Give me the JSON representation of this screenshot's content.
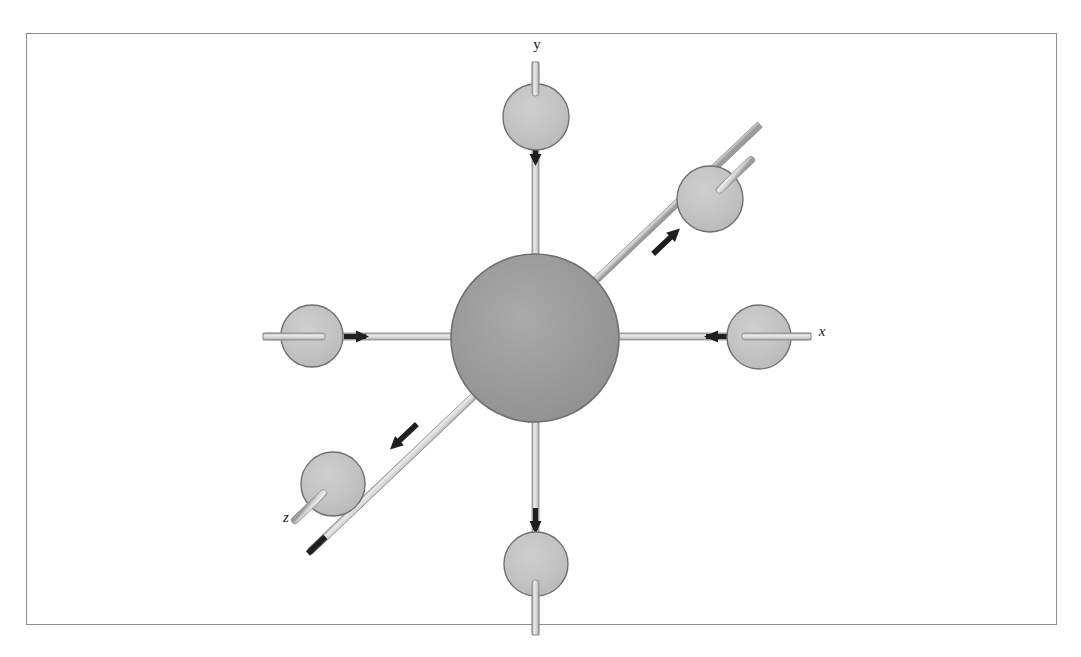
{
  "figure": {
    "frame": {
      "x": 26,
      "y": 33,
      "width": 1031,
      "height": 592,
      "border_color": "#8d8d8d",
      "background_color": "#ffffff"
    },
    "colors": {
      "center_sphere_fill": "#9a9a9a",
      "center_sphere_stroke": "#6f6f6f",
      "ligand_sphere_fill": "#c2c2c2",
      "ligand_sphere_stroke": "#6f6f6f",
      "bond_rod_fill": "#d8d8d8",
      "bond_rod_stroke": "#8c8c8c",
      "arrow_color": "#1f1f1f",
      "label_color": "#1a1a1a"
    },
    "center_atom": {
      "name": "central-sphere",
      "cx": 535,
      "cy": 338,
      "r": 84
    },
    "axes": [
      {
        "id": "y",
        "label": "y",
        "label_x": 537,
        "label_y": 49,
        "italic": false
      },
      {
        "id": "x",
        "label": "x",
        "label_x": 822,
        "label_y": 336,
        "italic": true
      },
      {
        "id": "z",
        "label": "z",
        "label_x": 286,
        "label_y": 522,
        "italic": true
      }
    ],
    "ligands": [
      {
        "id": "y-positive",
        "name": "ligand-sphere-top",
        "cx": 536,
        "cy": 117,
        "r": 33,
        "angle_deg": 270
      },
      {
        "id": "y-negative",
        "name": "ligand-sphere-bottom",
        "cx": 536,
        "cy": 564,
        "r": 32,
        "angle_deg": 90
      },
      {
        "id": "x-positive",
        "name": "ligand-sphere-right",
        "cx": 759,
        "cy": 337,
        "r": 32,
        "angle_deg": 0
      },
      {
        "id": "x-negative",
        "name": "ligand-sphere-left",
        "cx": 312,
        "cy": 336,
        "r": 31,
        "angle_deg": 180
      },
      {
        "id": "z-negative",
        "name": "ligand-sphere-upper-right",
        "cx": 710,
        "cy": 199,
        "r": 33,
        "angle_deg": 315
      },
      {
        "id": "z-positive",
        "name": "ligand-sphere-lower-left",
        "cx": 333,
        "cy": 484,
        "r": 32,
        "angle_deg": 135
      }
    ],
    "bonds": [
      {
        "id": "bond-top",
        "from": "ligand-sphere-top",
        "to": "central-sphere",
        "arrow_direction": "down"
      },
      {
        "id": "bond-bottom",
        "from": "ligand-sphere-bottom",
        "to": "central-sphere",
        "arrow_direction": "down"
      },
      {
        "id": "bond-right",
        "from": "ligand-sphere-right",
        "to": "central-sphere",
        "arrow_direction": "left"
      },
      {
        "id": "bond-left",
        "from": "ligand-sphere-left",
        "to": "central-sphere",
        "arrow_direction": "right"
      },
      {
        "id": "bond-upper-right",
        "from": "central-sphere",
        "to": "ligand-sphere-upper-right",
        "arrow_direction": "up-right"
      },
      {
        "id": "bond-lower-left",
        "from": "central-sphere",
        "to": "ligand-sphere-lower-left",
        "arrow_direction": "down-left"
      }
    ]
  }
}
